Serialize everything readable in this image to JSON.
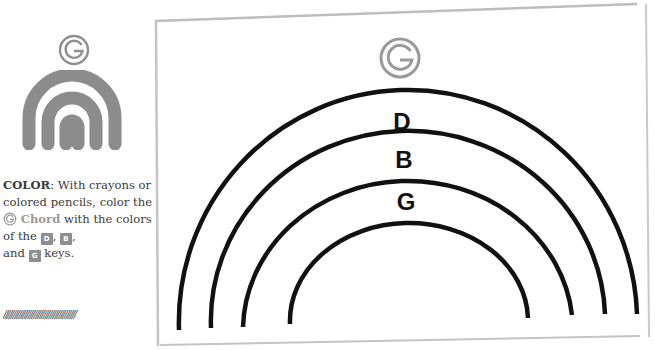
{
  "chord": {
    "symbol": "G",
    "name": "Chord"
  },
  "instructions": {
    "heading": "COLOR",
    "text_1": ": With crayons or colored pencils, color the ",
    "chord_label": "Chord",
    "text_2": " with the colors of the ",
    "sep_1": ", ",
    "sep_2": ",",
    "text_3": "and ",
    "text_4": " keys."
  },
  "keys": [
    {
      "label": "D"
    },
    {
      "label": "B"
    },
    {
      "label": "G"
    }
  ],
  "rainbow_labels": [
    {
      "label": "D"
    },
    {
      "label": "B"
    },
    {
      "label": "G"
    }
  ],
  "hatch": "//////////////////////////////////////",
  "colors": {
    "badge_gray": "#8f8f8f",
    "mini_rainbow_gray": "#8c8c8c",
    "arc_stroke": "#111111",
    "frame_gray": "#bdbdbd"
  }
}
